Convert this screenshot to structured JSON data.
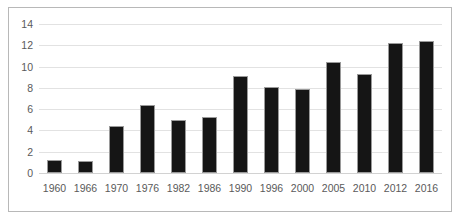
{
  "chart_data": {
    "type": "bar",
    "title": "",
    "subtitle": "",
    "xlabel": "",
    "ylabel": "",
    "categories": [
      "1960",
      "1966",
      "1970",
      "1976",
      "1982",
      "1986",
      "1990",
      "1996",
      "2000",
      "2005",
      "2010",
      "2012",
      "2016"
    ],
    "values": [
      1.2,
      1.1,
      4.4,
      6.4,
      5.0,
      5.3,
      9.1,
      8.1,
      7.9,
      10.4,
      9.3,
      12.2,
      12.4
    ],
    "series": [
      {
        "name": "",
        "values": [
          1.2,
          1.1,
          4.4,
          6.4,
          5.0,
          5.3,
          9.1,
          8.1,
          7.9,
          10.4,
          9.3,
          12.2,
          12.4
        ]
      }
    ],
    "ylim": [
      0,
      14
    ],
    "yticks": [
      0,
      2,
      4,
      6,
      8,
      10,
      12,
      14
    ],
    "ytick_labels": [
      "0",
      "2",
      "4",
      "6",
      "8",
      "10",
      "12",
      "14"
    ],
    "grid": true,
    "grid_axis": "y",
    "legend": false,
    "legend_position": "none",
    "bar_color": "#151515",
    "bar_edge_color": "#9a9a9a",
    "gridline_color": "#e2e2e2",
    "frame_color": "#b8b8b8",
    "tick_label_color": "#5a5a5a",
    "background_color": "#ffffff"
  }
}
